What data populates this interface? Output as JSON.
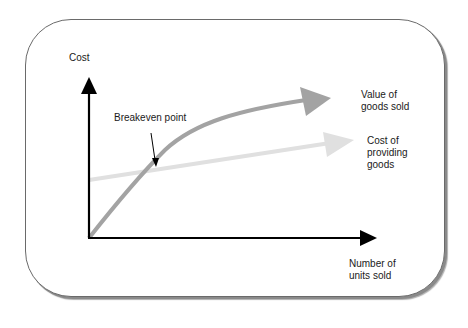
{
  "diagram": {
    "title": "",
    "axes": {
      "y_label": "Cost",
      "x_label": "Number of\nunits sold"
    },
    "series": [
      {
        "name": "value_of_goods_sold",
        "label": "Value of\ngoods sold",
        "color": "#a3a3a3",
        "shape": "concave curve from origin"
      },
      {
        "name": "cost_of_providing_goods",
        "label": "Cost of\nproviding\ngoods",
        "color": "#e0e0e0",
        "shape": "straight line with positive intercept"
      }
    ],
    "annotation": {
      "label": "Breakeven point",
      "points_to": "intersection of the two lines"
    },
    "colors": {
      "axis": "#000000",
      "frame_border": "#6a6a6a",
      "value_line": "#a3a3a3",
      "cost_line": "#e0e0e0"
    }
  }
}
